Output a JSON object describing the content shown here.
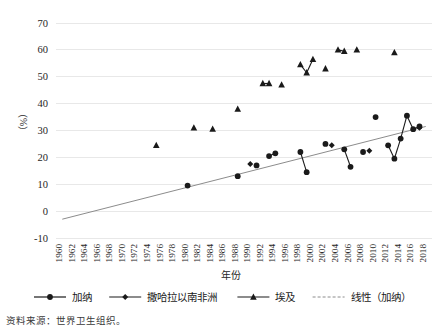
{
  "chart_data": {
    "type": "scatter",
    "title": "",
    "xlabel": "年份",
    "ylabel": "（%）",
    "xlim": [
      1959,
      2019
    ],
    "ylim": [
      -10,
      70
    ],
    "yticks": [
      -10,
      0,
      10,
      20,
      30,
      40,
      50,
      60,
      70
    ],
    "xticks": [
      1960,
      1962,
      1964,
      1966,
      1968,
      1970,
      1972,
      1974,
      1976,
      1978,
      1980,
      1982,
      1984,
      1986,
      1988,
      1990,
      1992,
      1994,
      1996,
      1998,
      2000,
      2002,
      2004,
      2006,
      2008,
      2010,
      2012,
      2014,
      2016,
      2018
    ],
    "grid": "horizontal",
    "legend_position": "bottom",
    "series": [
      {
        "name": "加纳",
        "marker": "circle",
        "color": "#1a1a1a",
        "connect_gaps": false,
        "points": [
          {
            "x": 1980,
            "y": 9.5
          },
          {
            "x": 1988,
            "y": 13.0
          },
          {
            "x": 1991,
            "y": 17.0
          },
          {
            "x": 1993,
            "y": 20.5
          },
          {
            "x": 1994,
            "y": 21.5
          },
          {
            "x": 1998,
            "y": 22.0
          },
          {
            "x": 1999,
            "y": 14.5
          },
          {
            "x": 2002,
            "y": 25.0
          },
          {
            "x": 2005,
            "y": 23.0
          },
          {
            "x": 2006,
            "y": 16.5
          },
          {
            "x": 2008,
            "y": 22.0
          },
          {
            "x": 2010,
            "y": 35.0
          },
          {
            "x": 2012,
            "y": 24.5
          },
          {
            "x": 2013,
            "y": 19.5
          },
          {
            "x": 2014,
            "y": 27.0
          },
          {
            "x": 2015,
            "y": 35.5
          },
          {
            "x": 2016,
            "y": 30.5
          },
          {
            "x": 2017,
            "y": 31.5
          }
        ]
      },
      {
        "name": "撒哈拉以南非洲",
        "marker": "diamond",
        "color": "#1a1a1a",
        "points": [
          {
            "x": 1990,
            "y": 17.5
          },
          {
            "x": 2003,
            "y": 24.5
          },
          {
            "x": 2009,
            "y": 22.5
          },
          {
            "x": 2017,
            "y": 31.0
          }
        ]
      },
      {
        "name": "埃及",
        "marker": "triangle",
        "color": "#1a1a1a",
        "points": [
          {
            "x": 1975,
            "y": 24.5
          },
          {
            "x": 1981,
            "y": 31.0
          },
          {
            "x": 1984,
            "y": 30.5
          },
          {
            "x": 1988,
            "y": 38.0
          },
          {
            "x": 1992,
            "y": 47.5
          },
          {
            "x": 1993,
            "y": 47.5
          },
          {
            "x": 1995,
            "y": 47.0
          },
          {
            "x": 1998,
            "y": 54.5
          },
          {
            "x": 1999,
            "y": 51.5
          },
          {
            "x": 2000,
            "y": 56.5
          },
          {
            "x": 2002,
            "y": 53.0
          },
          {
            "x": 2004,
            "y": 60.0
          },
          {
            "x": 2005,
            "y": 59.5
          },
          {
            "x": 2007,
            "y": 60.0
          },
          {
            "x": 2013,
            "y": 59.0
          }
        ]
      },
      {
        "name": "线性（加纳）",
        "marker": "none",
        "style": "trendline",
        "color": "#8c8c8c",
        "points": [
          {
            "x": 1960,
            "y": -3.0
          },
          {
            "x": 2018,
            "y": 31.5
          }
        ]
      }
    ]
  },
  "axes": {
    "y_axis_title": "（%）",
    "x_axis_title": "年份",
    "y_tick_labels": [
      "70",
      "60",
      "50",
      "40",
      "30",
      "20",
      "10",
      "0",
      "-10"
    ],
    "x_tick_labels": [
      "1960",
      "1962",
      "1964",
      "1966",
      "1968",
      "1970",
      "1972",
      "1974",
      "1976",
      "1978",
      "1980",
      "1982",
      "1984",
      "1986",
      "1988",
      "1990",
      "1992",
      "1994",
      "1996",
      "1998",
      "2000",
      "2002",
      "2004",
      "2006",
      "2008",
      "2010",
      "2012",
      "2014",
      "2016",
      "2018"
    ]
  },
  "legend": {
    "items": [
      {
        "label": "加纳",
        "marker": "circle",
        "line": "solid"
      },
      {
        "label": "撒哈拉以南非洲",
        "marker": "diamond",
        "line": "solid"
      },
      {
        "label": "埃及",
        "marker": "triangle",
        "line": "solid"
      },
      {
        "label": "线性（加纳）",
        "marker": "none",
        "line": "dashed"
      }
    ]
  },
  "footer": {
    "source": "资料来源：世界卫生组织。"
  },
  "colors": {
    "series": "#1a1a1a",
    "trend": "#8c8c8c",
    "grid": "#e8e8e8",
    "background": "#ffffff"
  }
}
